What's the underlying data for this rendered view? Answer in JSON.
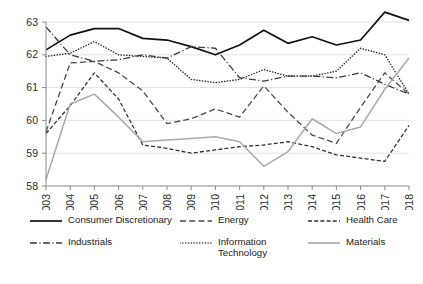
{
  "chart_data": {
    "type": "line",
    "title": "",
    "xlabel": "",
    "ylabel": "",
    "categories": [
      "2003",
      "2004",
      "2005",
      "2006",
      "2007",
      "2008",
      "2009",
      "2010",
      "2011",
      "2012",
      "2013",
      "2014",
      "2015",
      "2016",
      "2017",
      "2018"
    ],
    "x": [
      2003,
      2004,
      2005,
      2006,
      2007,
      2008,
      2009,
      2010,
      2011,
      2012,
      2013,
      2014,
      2015,
      2016,
      2017,
      2018
    ],
    "ylim": [
      58,
      63
    ],
    "xlim": [
      2003,
      2018
    ],
    "yticks": [
      58,
      59,
      60,
      61,
      62,
      63
    ],
    "grid": true,
    "legend_position": "bottom",
    "series": [
      {
        "name": "Consumer Discretionary",
        "style": "solid",
        "color": "#111111",
        "width": 1.7,
        "values": [
          62.15,
          62.6,
          62.8,
          62.8,
          62.5,
          62.45,
          62.25,
          62.0,
          62.3,
          62.75,
          62.35,
          62.55,
          62.3,
          62.45,
          63.3,
          63.05
        ]
      },
      {
        "name": "Energy",
        "style": "dashed",
        "color": "#4a4a4a",
        "width": 1.3,
        "values": [
          59.65,
          61.75,
          61.8,
          61.45,
          60.9,
          59.9,
          60.05,
          60.35,
          60.1,
          61.05,
          60.25,
          59.55,
          59.3,
          60.4,
          61.45,
          60.8
        ]
      },
      {
        "name": "Health Care",
        "style": "shortdash",
        "color": "#333333",
        "width": 1.3,
        "values": [
          59.6,
          60.45,
          61.45,
          60.65,
          59.25,
          59.15,
          59.0,
          59.1,
          59.2,
          59.25,
          59.35,
          59.2,
          58.95,
          58.85,
          58.75,
          59.85
        ]
      },
      {
        "name": "Industrials",
        "style": "dashdot",
        "color": "#3c3c3c",
        "width": 1.3,
        "values": [
          62.85,
          62.0,
          61.8,
          61.85,
          62.0,
          61.9,
          62.25,
          62.2,
          61.3,
          61.2,
          61.35,
          61.35,
          61.3,
          61.45,
          61.1,
          60.8
        ]
      },
      {
        "name": "Information Technology",
        "style": "dotted",
        "color": "#2e2e2e",
        "width": 1.5,
        "values": [
          61.95,
          62.05,
          62.4,
          62.0,
          61.95,
          61.9,
          61.25,
          61.15,
          61.25,
          61.55,
          61.35,
          61.35,
          61.5,
          62.2,
          62.0,
          60.8
        ]
      },
      {
        "name": "Materials",
        "style": "solid",
        "color": "#aaaaaa",
        "width": 1.5,
        "values": [
          58.2,
          60.5,
          60.8,
          60.1,
          59.35,
          59.4,
          59.45,
          59.5,
          59.35,
          58.6,
          59.05,
          60.05,
          59.6,
          59.8,
          60.95,
          61.9
        ]
      }
    ]
  },
  "legend": {
    "items": [
      {
        "label": "Consumer Discretionary",
        "style": "solid",
        "color": "#111111"
      },
      {
        "label": "Energy",
        "style": "dashed",
        "color": "#4a4a4a"
      },
      {
        "label": "Health Care",
        "style": "shortdash",
        "color": "#333333"
      },
      {
        "label": "Industrials",
        "style": "dashdot",
        "color": "#3c3c3c"
      },
      {
        "label": "Information Technology",
        "style": "dotted",
        "color": "#2e2e2e"
      },
      {
        "label": "Materials",
        "style": "solid",
        "color": "#aaaaaa"
      }
    ]
  },
  "axes": {
    "y_tick_labels": [
      "63",
      "62",
      "61",
      "60",
      "59",
      "58"
    ],
    "x_tick_labels": [
      "2003",
      "2004",
      "2005",
      "2006",
      "2007",
      "2008",
      "2009",
      "2010",
      "2011",
      "2012",
      "2013",
      "2014",
      "2015",
      "2016",
      "2017",
      "2018"
    ]
  }
}
